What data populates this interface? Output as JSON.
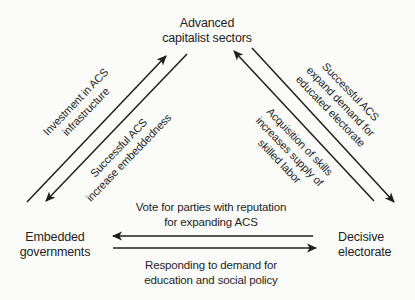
{
  "colors": {
    "ink": "#1e1e1e",
    "background": "#fbfbfa"
  },
  "diagram": {
    "nodes": {
      "acs": {
        "lines": [
          "Advanced",
          "capitalist sectors"
        ]
      },
      "governments": {
        "lines": [
          "Embedded",
          "governments"
        ]
      },
      "electorate": {
        "lines": [
          "Decisive",
          "electorate"
        ]
      }
    },
    "edges": {
      "investment": {
        "from": "governments",
        "to": "acs",
        "lines": [
          "Investment in ACS",
          "infrastructure"
        ]
      },
      "embeddedness": {
        "from": "acs",
        "to": "governments",
        "lines": [
          "Successful ACS",
          "increase embeddedness"
        ]
      },
      "expand_demand": {
        "from": "acs",
        "to": "electorate",
        "lines": [
          "Successful ACS",
          "expand demand for",
          "educated electorate"
        ]
      },
      "skills_supply": {
        "from": "electorate",
        "to": "acs",
        "lines": [
          "Acquisition of skills",
          "increases supply of",
          "skilled labor"
        ]
      },
      "vote": {
        "from": "electorate",
        "to": "governments",
        "lines": [
          "Vote for parties with reputation",
          "for expanding ACS"
        ]
      },
      "respond": {
        "from": "governments",
        "to": "electorate",
        "lines": [
          "Responding to demand for",
          "education and social policy"
        ]
      }
    }
  }
}
